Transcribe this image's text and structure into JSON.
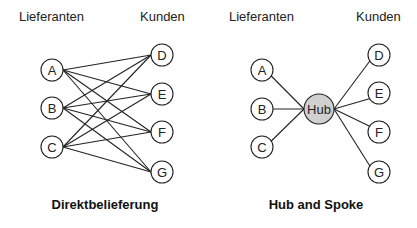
{
  "diagrams": [
    {
      "id": "direct",
      "header_left": "Lieferanten",
      "header_right": "Kunden",
      "caption": "Direktbelieferung",
      "suppliers": [
        {
          "label": "A",
          "x": 52,
          "y": 70
        },
        {
          "label": "B",
          "x": 52,
          "y": 108
        },
        {
          "label": "C",
          "x": 52,
          "y": 147
        }
      ],
      "customers": [
        {
          "label": "D",
          "x": 162,
          "y": 55
        },
        {
          "label": "E",
          "x": 162,
          "y": 94
        },
        {
          "label": "F",
          "x": 162,
          "y": 132
        },
        {
          "label": "G",
          "x": 162,
          "y": 172
        }
      ],
      "edges": "all suppliers to all customers"
    },
    {
      "id": "hub",
      "header_left": "Lieferanten",
      "header_right": "Kunden",
      "caption": "Hub and Spoke",
      "hub": {
        "label": "Hub",
        "x": 319,
        "y": 109,
        "fill": "#d0d0d0"
      },
      "suppliers": [
        {
          "label": "A",
          "x": 262,
          "y": 70
        },
        {
          "label": "B",
          "x": 262,
          "y": 109
        },
        {
          "label": "C",
          "x": 262,
          "y": 147
        }
      ],
      "customers": [
        {
          "label": "D",
          "x": 379,
          "y": 55
        },
        {
          "label": "E",
          "x": 379,
          "y": 93
        },
        {
          "label": "F",
          "x": 379,
          "y": 132
        },
        {
          "label": "G",
          "x": 379,
          "y": 172
        }
      ],
      "edges": "all nodes to hub"
    }
  ]
}
